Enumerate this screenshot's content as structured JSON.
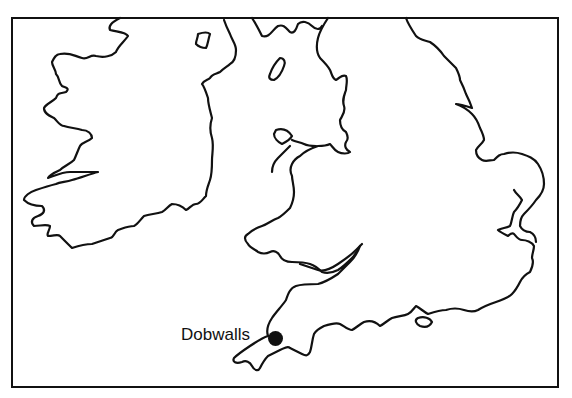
{
  "map": {
    "region": "Ireland and southern Great Britain",
    "marker": {
      "label": "Dobwalls",
      "color": "#111111"
    },
    "stroke_color": "#111111",
    "background": "#ffffff"
  }
}
